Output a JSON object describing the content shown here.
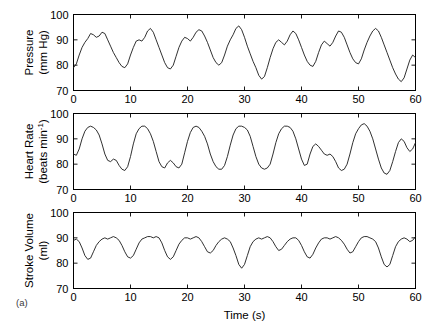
{
  "figure": {
    "panel_label": "(a)",
    "xlabel": "Time (s)",
    "background": "#ffffff",
    "trace_color": "#1a1a1a",
    "axis_color": "#000000"
  },
  "chart_data": [
    {
      "type": "line",
      "title": "",
      "ylabel": "Pressure (mm Hg)",
      "ylabel_line1": "Pressure",
      "ylabel_line2": "(mm Hg)",
      "xlabel": "Time (s)",
      "xlim": [
        0,
        60
      ],
      "ylim": [
        70,
        100
      ],
      "xticks": [
        0,
        10,
        20,
        30,
        40,
        50,
        60
      ],
      "yticks": [
        70,
        80,
        90,
        100
      ],
      "grid": false,
      "legend": null,
      "x": [
        0,
        0.5,
        1,
        1.5,
        2,
        2.5,
        3,
        3.5,
        4,
        4.5,
        5,
        5.5,
        6,
        6.5,
        7,
        7.5,
        8,
        8.5,
        9,
        9.5,
        10,
        10.5,
        11,
        11.5,
        12,
        12.5,
        13,
        13.5,
        14,
        14.5,
        15,
        15.5,
        16,
        16.5,
        17,
        17.5,
        18,
        18.5,
        19,
        19.5,
        20,
        20.5,
        21,
        21.5,
        22,
        22.5,
        23,
        23.5,
        24,
        24.5,
        25,
        25.5,
        26,
        26.5,
        27,
        27.5,
        28,
        28.5,
        29,
        29.5,
        30,
        30.5,
        31,
        31.5,
        32,
        32.5,
        33,
        33.5,
        34,
        34.5,
        35,
        35.5,
        36,
        36.5,
        37,
        37.5,
        38,
        38.5,
        39,
        39.5,
        40,
        40.5,
        41,
        41.5,
        42,
        42.5,
        43,
        43.5,
        44,
        44.5,
        45,
        45.5,
        46,
        46.5,
        47,
        47.5,
        48,
        48.5,
        49,
        49.5,
        50,
        50.5,
        51,
        51.5,
        52,
        52.5,
        53,
        53.5,
        54,
        54.5,
        55,
        55.5,
        56,
        56.5,
        57,
        57.5,
        58,
        58.5,
        59,
        59.5,
        60
      ],
      "values": [
        79,
        80.5,
        84,
        87,
        89,
        90.5,
        92.5,
        92,
        91,
        91.5,
        93,
        92.5,
        90,
        87.5,
        85,
        83,
        81,
        79.5,
        79,
        80.5,
        84,
        87,
        89.5,
        90,
        89.5,
        91,
        93.5,
        94.5,
        93,
        90,
        87,
        84,
        81,
        79,
        78.5,
        80,
        83.5,
        87,
        89.5,
        91,
        90.5,
        89.5,
        91,
        93,
        94,
        93.5,
        91.5,
        89,
        86,
        83,
        81,
        80,
        81,
        84,
        87.5,
        90,
        92,
        94.5,
        95.5,
        94,
        91,
        87.5,
        84.5,
        81.5,
        79,
        76,
        74.5,
        75.5,
        79,
        83,
        86.5,
        89,
        90,
        89,
        88,
        89.5,
        92,
        93.5,
        92.5,
        90,
        87,
        84,
        81.5,
        80,
        79.5,
        81.5,
        85,
        88,
        89.5,
        88.5,
        87.5,
        89,
        91.5,
        93.5,
        93,
        91,
        88,
        85,
        82.5,
        81,
        80.5,
        82.5,
        86,
        89,
        91.5,
        93.5,
        94.5,
        93.5,
        91,
        88,
        85,
        82,
        79,
        76.5,
        74.5,
        73.5,
        75,
        78.5,
        82,
        84,
        83,
        82.5,
        84.5,
        87,
        89,
        90.5,
        92,
        93.5
      ]
    },
    {
      "type": "line",
      "title": "",
      "ylabel": "Heart Rate (beats min^-1)",
      "ylabel_line1": "Heart Rate",
      "ylabel_line2_pre": "(beats min",
      "ylabel_line2_sup": "-1",
      "ylabel_line2_post": ")",
      "xlabel": "Time (s)",
      "xlim": [
        0,
        60
      ],
      "ylim": [
        70,
        100
      ],
      "xticks": [
        0,
        10,
        20,
        30,
        40,
        50,
        60
      ],
      "yticks": [
        70,
        80,
        90,
        100
      ],
      "grid": false,
      "legend": null,
      "x": [
        0,
        0.5,
        1,
        1.5,
        2,
        2.5,
        3,
        3.5,
        4,
        4.5,
        5,
        5.5,
        6,
        6.5,
        7,
        7.5,
        8,
        8.5,
        9,
        9.5,
        10,
        10.5,
        11,
        11.5,
        12,
        12.5,
        13,
        13.5,
        14,
        14.5,
        15,
        15.5,
        16,
        16.5,
        17,
        17.5,
        18,
        18.5,
        19,
        19.5,
        20,
        20.5,
        21,
        21.5,
        22,
        22.5,
        23,
        23.5,
        24,
        24.5,
        25,
        25.5,
        26,
        26.5,
        27,
        27.5,
        28,
        28.5,
        29,
        29.5,
        30,
        30.5,
        31,
        31.5,
        32,
        32.5,
        33,
        33.5,
        34,
        34.5,
        35,
        35.5,
        36,
        36.5,
        37,
        37.5,
        38,
        38.5,
        39,
        39.5,
        40,
        40.5,
        41,
        41.5,
        42,
        42.5,
        43,
        43.5,
        44,
        44.5,
        45,
        45.5,
        46,
        46.5,
        47,
        47.5,
        48,
        48.5,
        49,
        49.5,
        50,
        50.5,
        51,
        51.5,
        52,
        52.5,
        53,
        53.5,
        54,
        54.5,
        55,
        55.5,
        56,
        56.5,
        57,
        57.5,
        58,
        58.5,
        59,
        59.5,
        60
      ],
      "values": [
        84,
        83.5,
        86,
        90,
        93,
        94.5,
        95,
        94.5,
        93.5,
        91.5,
        88,
        84,
        81.5,
        81,
        82,
        81.5,
        79.5,
        78,
        77.5,
        79,
        83,
        88,
        92,
        94,
        95,
        95,
        94,
        92,
        89,
        85,
        81,
        79,
        78.5,
        80.5,
        81.5,
        80.5,
        79,
        78.5,
        80,
        84.5,
        89,
        92.5,
        94.5,
        95,
        94.5,
        93,
        91,
        88,
        84,
        81,
        79,
        78,
        78,
        79.5,
        83,
        87.5,
        91.5,
        94,
        95,
        95,
        94.5,
        93.5,
        91,
        87,
        83,
        80,
        78.5,
        78,
        78.5,
        80,
        84,
        88.5,
        92,
        94,
        95,
        95,
        94.5,
        93,
        90,
        86,
        82,
        79.5,
        80,
        84,
        87,
        88,
        87,
        85.5,
        84,
        83.5,
        84,
        83,
        81,
        78.5,
        77.5,
        78,
        80,
        84,
        88.5,
        92,
        94,
        95.5,
        96,
        95,
        93,
        90,
        86,
        82,
        78.5,
        76.5,
        76,
        77.5,
        81,
        85,
        88.5,
        90,
        89,
        86.5,
        85,
        86,
        88.5
      ]
    },
    {
      "type": "line",
      "title": "",
      "ylabel": "Stroke Volume (ml)",
      "ylabel_line1": "Stroke Volume",
      "ylabel_line2": "(ml)",
      "xlabel": "Time (s)",
      "xlim": [
        0,
        60
      ],
      "ylim": [
        70,
        100
      ],
      "xticks": [
        0,
        10,
        20,
        30,
        40,
        50,
        60
      ],
      "yticks": [
        70,
        80,
        90,
        100
      ],
      "grid": false,
      "legend": null,
      "x": [
        0,
        0.5,
        1,
        1.5,
        2,
        2.5,
        3,
        3.5,
        4,
        4.5,
        5,
        5.5,
        6,
        6.5,
        7,
        7.5,
        8,
        8.5,
        9,
        9.5,
        10,
        10.5,
        11,
        11.5,
        12,
        12.5,
        13,
        13.5,
        14,
        14.5,
        15,
        15.5,
        16,
        16.5,
        17,
        17.5,
        18,
        18.5,
        19,
        19.5,
        20,
        20.5,
        21,
        21.5,
        22,
        22.5,
        23,
        23.5,
        24,
        24.5,
        25,
        25.5,
        26,
        26.5,
        27,
        27.5,
        28,
        28.5,
        29,
        29.5,
        30,
        30.5,
        31,
        31.5,
        32,
        32.5,
        33,
        33.5,
        34,
        34.5,
        35,
        35.5,
        36,
        36.5,
        37,
        37.5,
        38,
        38.5,
        39,
        39.5,
        40,
        40.5,
        41,
        41.5,
        42,
        42.5,
        43,
        43.5,
        44,
        44.5,
        45,
        45.5,
        46,
        46.5,
        47,
        47.5,
        48,
        48.5,
        49,
        49.5,
        50,
        50.5,
        51,
        51.5,
        52,
        52.5,
        53,
        53.5,
        54,
        54.5,
        55,
        55.5,
        56,
        56.5,
        57,
        57.5,
        58,
        58.5,
        59,
        59.5,
        60
      ],
      "values": [
        89,
        89.5,
        88.5,
        86,
        83,
        81.5,
        82,
        84.5,
        87,
        88.5,
        89.5,
        90,
        89.5,
        90,
        90.5,
        90,
        89,
        87,
        84.5,
        82.5,
        82,
        83,
        85.5,
        88,
        89.5,
        90,
        90.5,
        90.5,
        90,
        90.5,
        90,
        88,
        85,
        82.5,
        81.5,
        82.5,
        85,
        87.5,
        89,
        90,
        90,
        89.5,
        90,
        90.5,
        90,
        88.5,
        86.5,
        84.5,
        84,
        85,
        87,
        88.5,
        89.5,
        90,
        89.5,
        88.5,
        86,
        83,
        79.5,
        78,
        79.5,
        83,
        86.5,
        88.5,
        89.5,
        90,
        89.5,
        90,
        90.5,
        90,
        88.5,
        86.5,
        85,
        85.5,
        87,
        88.5,
        89.5,
        90,
        90,
        89,
        87,
        84.5,
        82.5,
        82,
        83.5,
        86,
        88,
        89.5,
        90,
        90,
        89.5,
        90,
        90.5,
        90,
        89,
        87.5,
        85.5,
        84,
        84.5,
        86.5,
        88.5,
        90,
        90.5,
        90.5,
        90,
        89.5,
        88.5,
        86,
        82.5,
        79.5,
        78.5,
        79.5,
        83,
        86.5,
        88.5,
        89.5,
        90,
        89.5,
        88.5,
        89,
        90.5
      ]
    }
  ]
}
